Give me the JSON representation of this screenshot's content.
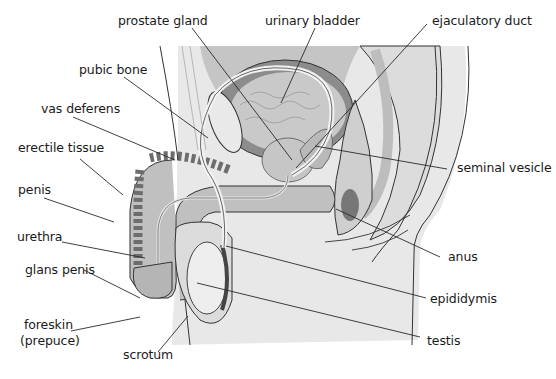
{
  "diagram": {
    "labels": {
      "prostate_gland": "prostate gland",
      "urinary_bladder": "urinary bladder",
      "ejaculatory_duct": "ejaculatory duct",
      "pubic_bone": "pubic bone",
      "vas_deferens": "vas deferens",
      "erectile_tissue": "erectile tissue",
      "seminal_vesicle": "seminal vesicle",
      "penis": "penis",
      "urethra": "urethra",
      "anus": "anus",
      "glans_penis": "glans penis",
      "epididymis": "epididymis",
      "foreskin_line1": "foreskin",
      "foreskin_line2": "(prepuce)",
      "testis": "testis",
      "scrotum": "scrotum"
    },
    "colors": {
      "skin": "#e6e6e6",
      "tissue_light": "#d2d2d2",
      "tissue_mid": "#b4b4b4",
      "tissue_dark": "#7a7a7a",
      "bladder_wall": "#8c8c8c",
      "outline": "#333333",
      "leader": "#2a2a2a",
      "text": "#1a1a1a"
    }
  }
}
